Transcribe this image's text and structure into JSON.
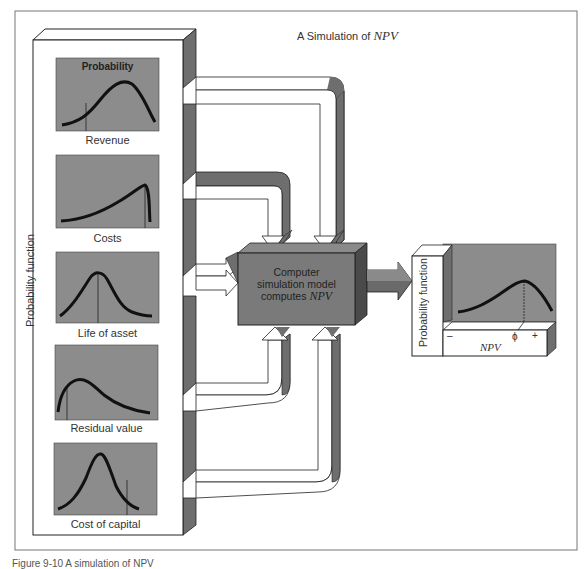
{
  "title": {
    "prefix": "A Simulation of ",
    "npv": "NPV"
  },
  "left_panel": {
    "axis_label": "Probability function",
    "top_chart_title": "Probability",
    "inputs": [
      {
        "label": "Revenue",
        "curve": "right-skewed-bell"
      },
      {
        "label": "Costs",
        "curve": "left-skewed-rising-sharp-drop"
      },
      {
        "label": "Life of asset",
        "curve": "symmetric-bell-with-mean-line"
      },
      {
        "label": "Residual value",
        "curve": "early-peak-long-tail"
      },
      {
        "label": "Cost of capital",
        "curve": "narrow-bell"
      }
    ]
  },
  "center_box": {
    "line1": "Computer",
    "line2": "simulation model",
    "line3_prefix": "computes ",
    "line3_npv": "NPV"
  },
  "output": {
    "axis_label": "Probability function",
    "x_label": "NPV",
    "ticks": {
      "minus": "–",
      "zero": "ϕ",
      "plus": "+"
    }
  },
  "caption": "Figure 9-10  A simulation of NPV",
  "colors": {
    "panel_gray": "#8c8c8c",
    "bevel_gray": "#6e6e6e",
    "dark_bevel": "#4a4a4a",
    "box_gray": "#7a7a7a",
    "line": "#111111"
  }
}
